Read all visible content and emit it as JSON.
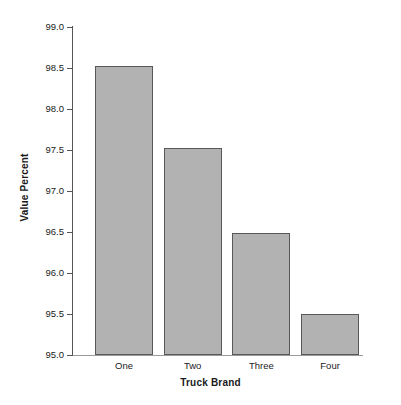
{
  "chart_data": {
    "type": "bar",
    "title": "",
    "subtitle": "",
    "xlabel": "Truck Brand",
    "ylabel": "Value Percent",
    "categories": [
      "One",
      "Two",
      "Three",
      "Four"
    ],
    "values": [
      98.52,
      97.52,
      96.49,
      95.5
    ],
    "series": [
      {
        "name": "Value Percent",
        "values": [
          98.52,
          97.52,
          96.49,
          95.5
        ]
      }
    ],
    "ylim": [
      95.0,
      99.0
    ],
    "ytick_labels": [
      "99.0",
      "98.5",
      "98.0",
      "97.5",
      "97.0",
      "96.5",
      "96.0",
      "95.5",
      "95.0"
    ],
    "ytick_values": [
      99.0,
      98.5,
      98.0,
      97.5,
      97.0,
      96.5,
      96.0,
      95.5,
      95.0
    ],
    "ytick_step": 0.5,
    "grid": false,
    "legend": false,
    "legend_position": "none",
    "bar_fill_color": "#b2b2b2",
    "bar_border_color": "#585858",
    "axis_color": "#555555",
    "text_color": "#1a1a1a",
    "background_color": "#ffffff",
    "annotations": []
  }
}
